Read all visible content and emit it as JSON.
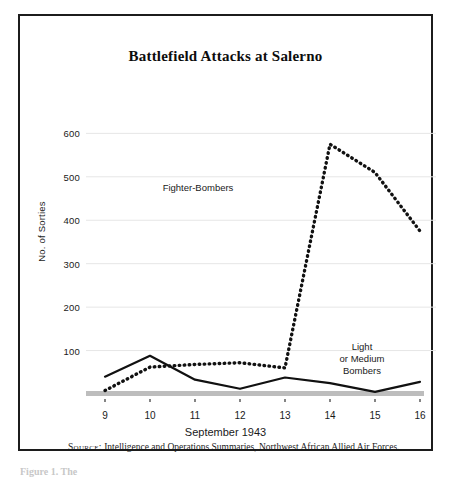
{
  "figure": {
    "title": "Battlefield Attacks at Salerno",
    "source_label": "Source:",
    "source_text": "Intelligence and Operations Summaries, Northwest African Allied Air Forces.",
    "caption": "Figure 1. The"
  },
  "chart_data": {
    "type": "line",
    "title": "Battlefield Attacks at Salerno",
    "xlabel": "September 1943",
    "ylabel": "No. of Sorties",
    "x": [
      9,
      10,
      11,
      12,
      13,
      14,
      15,
      16
    ],
    "xtick_labels": [
      "9",
      "10",
      "11",
      "12",
      "13",
      "14",
      "15",
      "16"
    ],
    "ytick_labels": [
      "100",
      "200",
      "300",
      "400",
      "500",
      "600"
    ],
    "yticks": [
      100,
      200,
      300,
      400,
      500,
      600
    ],
    "ylim": [
      0,
      640
    ],
    "xlim": [
      9,
      16
    ],
    "grid": "horizontal",
    "legend": "in-plot annotations",
    "series": [
      {
        "name": "Fighter-Bombers",
        "style": "dotted",
        "color": "#111111",
        "values": [
          8,
          62,
          68,
          72,
          60,
          575,
          510,
          375
        ],
        "annotation": "Fighter-Bombers"
      },
      {
        "name": "Light or Medium Bombers",
        "style": "solid",
        "color": "#111111",
        "values": [
          40,
          88,
          33,
          12,
          38,
          25,
          5,
          28
        ],
        "annotation_lines": [
          "Light",
          "or Medium",
          "Bombers"
        ]
      }
    ],
    "baseline": {
      "name": "axis-baseline-bar",
      "value": 0,
      "color": "#bdbdbd"
    },
    "colors": {
      "frame": "#1c1c1c",
      "gridline": "#e6e6e6",
      "text": "#1a1a1a",
      "baseline": "#bdbdbd"
    }
  }
}
